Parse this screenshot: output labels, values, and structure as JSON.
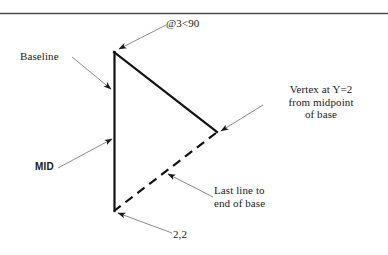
{
  "figure": {
    "background_color": "#ffffff",
    "ink_color": "#1a1a1a",
    "leader_color": "#808080",
    "top_rule": {
      "name": "horizontal-rule",
      "color": "#4d4d4d"
    }
  },
  "shape": {
    "name": "triangle",
    "vertices": {
      "top": "114,52",
      "bottom": "114,211",
      "right": "216,132"
    },
    "edges": [
      {
        "name": "baseline-edge",
        "style": "solid",
        "from": "top",
        "to": "bottom"
      },
      {
        "name": "upper-edge",
        "style": "solid",
        "from": "top",
        "to": "right"
      },
      {
        "name": "closing-edge",
        "style": "dashed",
        "from": "right",
        "to": "bottom"
      }
    ]
  },
  "annotations": {
    "angle_spec": "@3<90",
    "baseline": "Baseline",
    "mid": "MID",
    "vertex_note_line1": "Vertex at Y=2",
    "vertex_note_line2": "from midpoint",
    "vertex_note_line3": "of base",
    "last_line_note_line1": "Last line to",
    "last_line_note_line2": "end of base",
    "start_point": "2,2"
  }
}
